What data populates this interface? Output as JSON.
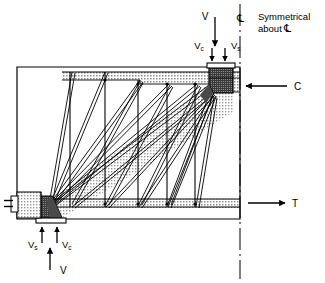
{
  "figure": {
    "type": "structural-engineering-diagram"
  },
  "labels": {
    "top_load": "V",
    "top_left_component": "V",
    "top_left_component_sub": "c",
    "top_right_component": "V",
    "top_right_component_sub": "s",
    "bottom_load": "V",
    "bottom_left_component": "V",
    "bottom_left_component_sub": "s",
    "bottom_right_component": "V",
    "bottom_right_component_sub": "c",
    "compression_force": "C",
    "tension_force": "T",
    "centerline_symbol": "℄",
    "symmetry_note_line1": "Symmetrical",
    "symmetry_note_line2_prefix": "about ",
    "symmetry_note_line2_symbol": "℄"
  },
  "colors": {
    "stroke": "#000000",
    "background": "#ffffff",
    "node_dark": "#2a2a2a",
    "node_mid": "#4a4a4a",
    "band_light": "#d8d8d8",
    "strut_fill": "#dcdcdc",
    "hatch_light": "#c8c8c8"
  },
  "geometry": {
    "beam_outline": {
      "left": 17,
      "top": 67,
      "right": 240,
      "bottom": 219
    },
    "centerline_x": 240,
    "top_chord_y": 72,
    "bottom_chord_y": 207,
    "stirrups_x": [
      70,
      105,
      138,
      167,
      195
    ],
    "node_top_right": {
      "x": 209,
      "y": 67,
      "w": 24,
      "h": 26
    },
    "node_bottom_left": {
      "x": 38,
      "y": 196,
      "w": 24,
      "h": 22
    }
  }
}
